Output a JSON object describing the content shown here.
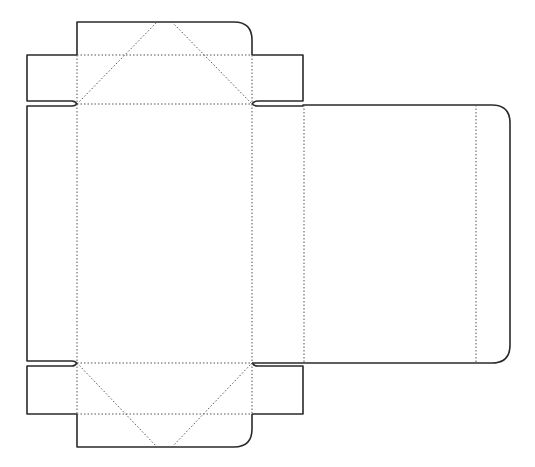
{
  "diagram": {
    "type": "box-dieline",
    "colors": {
      "cut_line": "#2a2a2a",
      "fold_line": "#555555",
      "background": "#ffffff"
    },
    "panels": [
      {
        "name": "top-tuck-flap"
      },
      {
        "name": "top-left-dust-flap"
      },
      {
        "name": "top-right-dust-flap"
      },
      {
        "name": "left-side-panel"
      },
      {
        "name": "front-panel"
      },
      {
        "name": "right-side-panel"
      },
      {
        "name": "back-panel"
      },
      {
        "name": "glue-flap"
      },
      {
        "name": "bottom-left-dust-flap"
      },
      {
        "name": "bottom-right-dust-flap"
      },
      {
        "name": "bottom-tuck-flap"
      }
    ]
  }
}
